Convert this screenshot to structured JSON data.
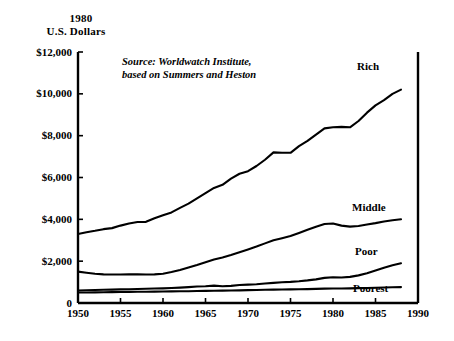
{
  "axis_title": {
    "line1": "1980",
    "line2": "U.S. Dollars"
  },
  "source_note": "Source: Worldwatch Institute,\nbased on Summers and Heston",
  "series_labels": {
    "rich": "Rich",
    "middle": "Middle",
    "poor": "Poor",
    "poorest": "Poorest"
  },
  "colors": {
    "line": "#000000",
    "axis": "#000000",
    "background": "#ffffff"
  },
  "chart_data": {
    "type": "line",
    "title": "1980 U.S. Dollars",
    "xlabel": "",
    "ylabel": "1980 U.S. Dollars",
    "xlim": [
      1950,
      1990
    ],
    "ylim": [
      0,
      12000
    ],
    "grid": false,
    "legend_position": "inline-right",
    "annotations": [
      "Source: Worldwatch Institute, based on Summers and Heston"
    ],
    "ytick_labels": [
      "$12,000",
      "$10,000",
      "$8,000",
      "$6,000",
      "$4,000",
      "$2,000",
      "0"
    ],
    "ytick_values": [
      12000,
      10000,
      8000,
      6000,
      4000,
      2000,
      0
    ],
    "xtick_labels": [
      "1950",
      "1955",
      "1960",
      "1965",
      "1970",
      "1975",
      "1980",
      "1985",
      "1990"
    ],
    "xtick_values": [
      1950,
      1955,
      1960,
      1965,
      1970,
      1975,
      1980,
      1985,
      1990
    ],
    "x": [
      1950,
      1951,
      1952,
      1953,
      1954,
      1955,
      1956,
      1957,
      1958,
      1959,
      1960,
      1961,
      1962,
      1963,
      1964,
      1965,
      1966,
      1967,
      1968,
      1969,
      1970,
      1971,
      1972,
      1973,
      1974,
      1975,
      1976,
      1977,
      1978,
      1979,
      1980,
      1981,
      1982,
      1983,
      1984,
      1985,
      1986,
      1987,
      1988
    ],
    "series": [
      {
        "name": "Rich",
        "values": [
          3300,
          3380,
          3450,
          3530,
          3580,
          3700,
          3800,
          3870,
          3880,
          4050,
          4200,
          4330,
          4550,
          4750,
          5000,
          5250,
          5500,
          5650,
          5950,
          6180,
          6300,
          6550,
          6850,
          7200,
          7180,
          7180,
          7500,
          7750,
          8050,
          8350,
          8400,
          8420,
          8400,
          8700,
          9100,
          9450,
          9700,
          10000,
          10200
        ]
      },
      {
        "name": "Middle",
        "values": [
          1500,
          1450,
          1400,
          1370,
          1360,
          1360,
          1370,
          1370,
          1360,
          1370,
          1400,
          1480,
          1580,
          1700,
          1820,
          1950,
          2080,
          2180,
          2300,
          2430,
          2560,
          2700,
          2850,
          3000,
          3100,
          3200,
          3350,
          3500,
          3650,
          3780,
          3800,
          3700,
          3650,
          3680,
          3750,
          3820,
          3900,
          3960,
          4000
        ]
      },
      {
        "name": "Poor",
        "values": [
          600,
          610,
          620,
          630,
          640,
          650,
          660,
          670,
          680,
          690,
          700,
          715,
          735,
          760,
          790,
          800,
          830,
          800,
          820,
          860,
          880,
          900,
          930,
          960,
          990,
          1010,
          1040,
          1080,
          1130,
          1200,
          1230,
          1220,
          1250,
          1320,
          1420,
          1550,
          1680,
          1800,
          1900
        ]
      },
      {
        "name": "Poorest",
        "values": [
          500,
          505,
          510,
          515,
          520,
          525,
          530,
          535,
          540,
          545,
          550,
          555,
          560,
          565,
          575,
          580,
          585,
          590,
          600,
          605,
          615,
          620,
          630,
          640,
          645,
          650,
          660,
          665,
          675,
          685,
          690,
          695,
          700,
          710,
          720,
          730,
          740,
          750,
          760
        ]
      }
    ]
  }
}
